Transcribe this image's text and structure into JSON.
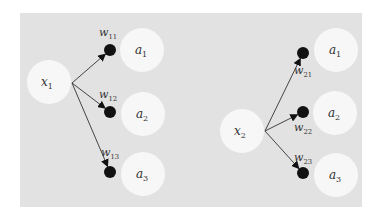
{
  "colors": {
    "background": "#ffffff",
    "panel": "#e2e2e2",
    "node_fill": "#f7f7f7",
    "weight_dot": "#111111",
    "edge": "#444444",
    "text": "#333333"
  },
  "panels": [
    {
      "input": {
        "var": "x",
        "sub": "1",
        "cx": 49,
        "cy": 82
      },
      "edges": [
        {
          "weight_var": "w",
          "weight_sub": "11",
          "dot": [
            110,
            50
          ],
          "label_pos": [
            108,
            36
          ],
          "output": {
            "var": "a",
            "sub": "1",
            "cx": 142,
            "cy": 50
          }
        },
        {
          "weight_var": "w",
          "weight_sub": "12",
          "dot": [
            110,
            112
          ],
          "label_pos": [
            108,
            98
          ],
          "output": {
            "var": "a",
            "sub": "2",
            "cx": 143,
            "cy": 114
          }
        },
        {
          "weight_var": "w",
          "weight_sub": "13",
          "dot": [
            110,
            172
          ],
          "label_pos": [
            110,
            156
          ],
          "output": {
            "var": "a",
            "sub": "3",
            "cx": 143,
            "cy": 174
          }
        }
      ],
      "origin": [
        72,
        83
      ]
    },
    {
      "input": {
        "var": "x",
        "sub": "2",
        "cx": 242,
        "cy": 131
      },
      "edges": [
        {
          "weight_var": "w",
          "weight_sub": "21",
          "dot": [
            303,
            53
          ],
          "label_pos": [
            303,
            74
          ],
          "output": {
            "var": "a",
            "sub": "1",
            "cx": 336,
            "cy": 50
          }
        },
        {
          "weight_var": "w",
          "weight_sub": "22",
          "dot": [
            303,
            112
          ],
          "label_pos": [
            303,
            131
          ],
          "output": {
            "var": "a",
            "sub": "2",
            "cx": 335,
            "cy": 113
          }
        },
        {
          "weight_var": "w",
          "weight_sub": "23",
          "dot": [
            303,
            173
          ],
          "label_pos": [
            303,
            161
          ],
          "output": {
            "var": "a",
            "sub": "3",
            "cx": 336,
            "cy": 175
          }
        }
      ],
      "origin": [
        265,
        131
      ]
    }
  ]
}
